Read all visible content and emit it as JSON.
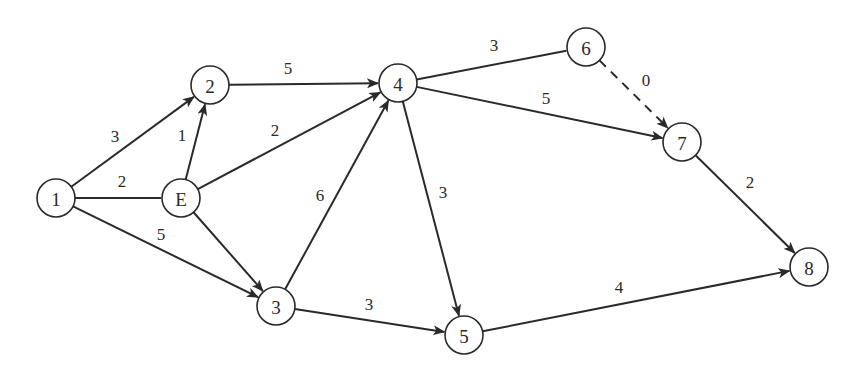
{
  "diagram": {
    "type": "directed-network",
    "nodes": [
      {
        "id": "1",
        "label": "1",
        "x": 56,
        "y": 198
      },
      {
        "id": "E",
        "label": "E",
        "x": 181,
        "y": 198
      },
      {
        "id": "2",
        "label": "2",
        "x": 210,
        "y": 85
      },
      {
        "id": "3",
        "label": "3",
        "x": 276,
        "y": 306
      },
      {
        "id": "4",
        "label": "4",
        "x": 398,
        "y": 83
      },
      {
        "id": "5",
        "label": "5",
        "x": 464,
        "y": 335
      },
      {
        "id": "6",
        "label": "6",
        "x": 586,
        "y": 47
      },
      {
        "id": "7",
        "label": "7",
        "x": 682,
        "y": 142
      },
      {
        "id": "8",
        "label": "8",
        "x": 809,
        "y": 267
      }
    ],
    "node_radius": 19,
    "edges": [
      {
        "from": "1",
        "to": "2",
        "weight": "3",
        "arrow": true,
        "dashed": false,
        "lx": 115,
        "ly": 136
      },
      {
        "from": "1",
        "to": "E",
        "weight": "2",
        "arrow": false,
        "dashed": false,
        "lx": 122,
        "ly": 181
      },
      {
        "from": "1",
        "to": "3",
        "weight": "5",
        "arrow": true,
        "dashed": false,
        "lx": 161,
        "ly": 234
      },
      {
        "from": "E",
        "to": "2",
        "weight": "1",
        "arrow": true,
        "dashed": false,
        "lx": 182,
        "ly": 135
      },
      {
        "from": "E",
        "to": "4",
        "weight": "2",
        "arrow": true,
        "dashed": false,
        "lx": 275,
        "ly": 130
      },
      {
        "from": "E",
        "to": "3",
        "weight": "",
        "arrow": true,
        "dashed": false,
        "lx": 0,
        "ly": 0
      },
      {
        "from": "2",
        "to": "4",
        "weight": "5",
        "arrow": true,
        "dashed": false,
        "lx": 288,
        "ly": 68
      },
      {
        "from": "3",
        "to": "4",
        "weight": "6",
        "arrow": true,
        "dashed": false,
        "lx": 320,
        "ly": 195
      },
      {
        "from": "3",
        "to": "5",
        "weight": "3",
        "arrow": true,
        "dashed": false,
        "lx": 369,
        "ly": 304
      },
      {
        "from": "4",
        "to": "6",
        "weight": "3",
        "arrow": false,
        "dashed": false,
        "lx": 494,
        "ly": 45
      },
      {
        "from": "4",
        "to": "7",
        "weight": "5",
        "arrow": true,
        "dashed": false,
        "lx": 546,
        "ly": 98
      },
      {
        "from": "4",
        "to": "5",
        "weight": "3",
        "arrow": true,
        "dashed": false,
        "lx": 443,
        "ly": 192
      },
      {
        "from": "6",
        "to": "7",
        "weight": "0",
        "arrow": true,
        "dashed": true,
        "lx": 646,
        "ly": 80
      },
      {
        "from": "7",
        "to": "8",
        "weight": "2",
        "arrow": true,
        "dashed": false,
        "lx": 750,
        "ly": 182
      },
      {
        "from": "5",
        "to": "8",
        "weight": "4",
        "arrow": true,
        "dashed": false,
        "lx": 619,
        "ly": 287
      }
    ]
  }
}
